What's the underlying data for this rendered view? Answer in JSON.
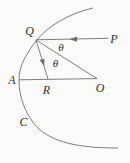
{
  "figure": {
    "labels": {
      "Q": "Q",
      "P": "P",
      "A": "A",
      "R": "R",
      "O": "O",
      "C": "C",
      "theta_upper": "θ",
      "theta_lower": "θ"
    },
    "colors": {
      "line": "#6f6f6f",
      "text": "#2f2f2f",
      "background": "#fbfbf9"
    }
  }
}
